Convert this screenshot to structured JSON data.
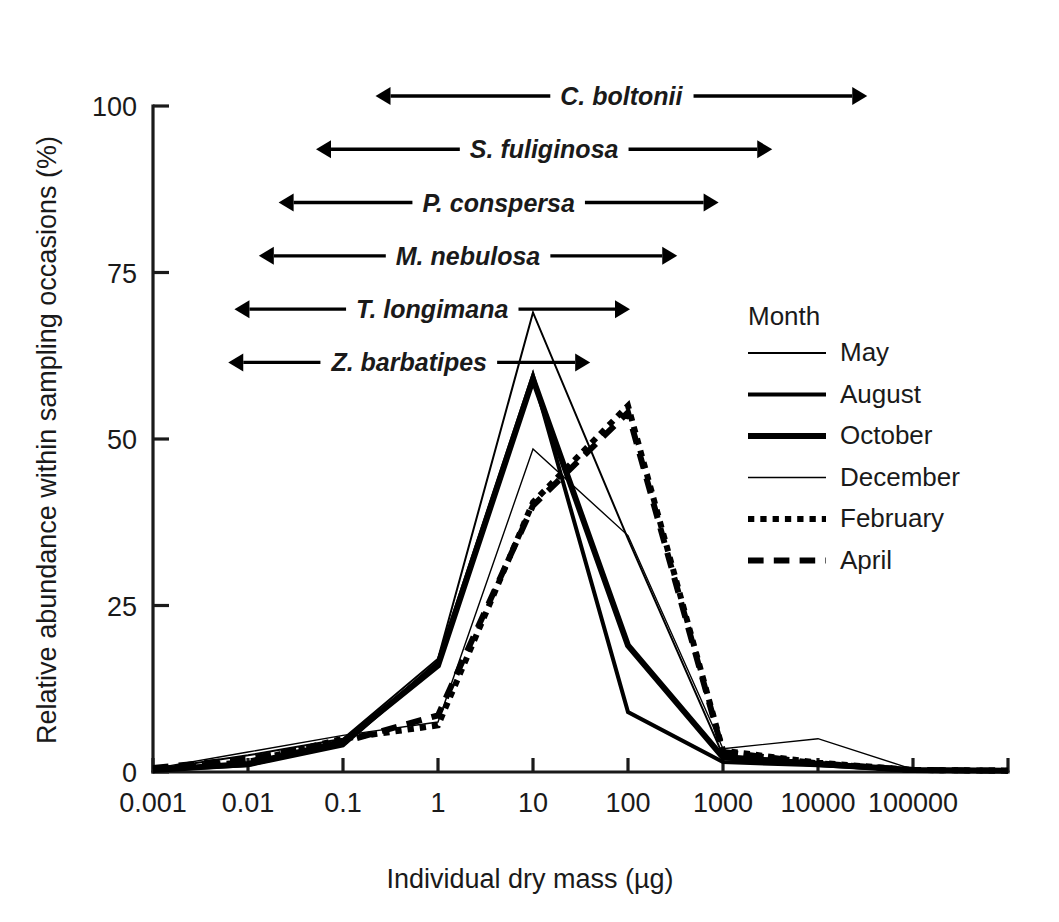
{
  "chart_data": {
    "type": "line",
    "title": "",
    "xlabel": "Individual dry mass (µg)",
    "ylabel": "Relative abundance within sampling occasions (%)",
    "x_scale": "log",
    "x_tick_labels": [
      "0.001",
      "0.01",
      "0.1",
      "1",
      "10",
      "100",
      "1000",
      "10000",
      "100000"
    ],
    "x_tick_values": [
      0.001,
      0.01,
      0.1,
      1,
      10,
      100,
      1000,
      10000,
      100000
    ],
    "xlim": [
      0.001,
      1000000
    ],
    "y_tick_labels": [
      "0",
      "25",
      "50",
      "75",
      "100"
    ],
    "y_tick_values": [
      0,
      25,
      50,
      75,
      100
    ],
    "ylim": [
      0,
      100
    ],
    "grid": false,
    "legend_position": "right-inside",
    "legend_title": "Month",
    "categories": [
      0.001,
      0.01,
      0.1,
      1,
      10,
      100,
      1000,
      10000,
      100000,
      1000000
    ],
    "series": [
      {
        "name": "May",
        "style": "solid",
        "line_width": 2,
        "values": [
          0.4,
          2.5,
          5.0,
          17.0,
          69.0,
          35.0,
          2.5,
          1.5,
          0.4,
          0.2
        ]
      },
      {
        "name": "August",
        "style": "solid",
        "line_width": 4,
        "values": [
          0.3,
          1.0,
          4.0,
          16.5,
          59.5,
          9.0,
          1.5,
          1.0,
          0.3,
          0.2
        ]
      },
      {
        "name": "October",
        "style": "solid",
        "line_width": 6,
        "values": [
          0.3,
          1.2,
          4.5,
          16.0,
          59.0,
          19.0,
          2.2,
          1.2,
          0.3,
          0.2
        ]
      },
      {
        "name": "December",
        "style": "solid",
        "line_width": 1.4,
        "values": [
          0.5,
          3.0,
          5.5,
          7.5,
          48.5,
          35.5,
          3.5,
          5.0,
          0.4,
          0.2
        ]
      },
      {
        "name": "February",
        "style": "dotted",
        "line_width": 6,
        "values": [
          0.4,
          1.5,
          5.0,
          7.0,
          40.5,
          55.0,
          3.2,
          1.4,
          0.3,
          0.2
        ]
      },
      {
        "name": "April",
        "style": "dashed",
        "line_width": 6,
        "values": [
          0.6,
          2.0,
          4.5,
          8.5,
          40.0,
          54.0,
          3.0,
          1.3,
          0.3,
          0.2
        ]
      }
    ],
    "annotations": [
      {
        "label": "C. boltonii",
        "x_start": 0.22,
        "x_end": 33000.0,
        "y": 101.5
      },
      {
        "label": "S. fuliginosa",
        "x_start": 0.052,
        "x_end": 3300.0,
        "y": 93.5
      },
      {
        "label": "P. conspersa",
        "x_start": 0.021,
        "x_end": 900.0,
        "y": 85.5
      },
      {
        "label": "M. nebulosa",
        "x_start": 0.013,
        "x_end": 330.0,
        "y": 77.5
      },
      {
        "label": "T. longimana",
        "x_start": 0.0072,
        "x_end": 105.0,
        "y": 69.5
      },
      {
        "label": "Z. barbatipes",
        "x_start": 0.0062,
        "x_end": 40.0,
        "y": 61.5
      }
    ]
  }
}
